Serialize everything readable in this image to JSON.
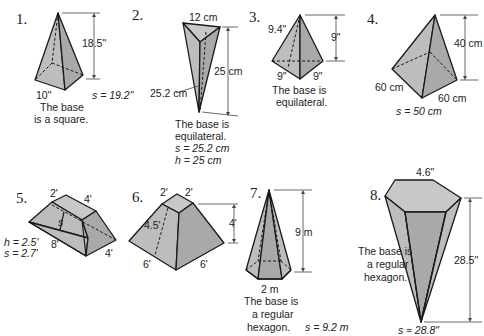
{
  "figures": [
    {
      "number": "1.",
      "dims": {
        "height": "18.5\"",
        "base_edge": "10\"",
        "slant": "s = 19.2\""
      },
      "note": [
        "The base",
        "is a square."
      ]
    },
    {
      "number": "2.",
      "dims": {
        "top_edge": "12 cm",
        "height": "25 cm",
        "slant_label": "25.2 cm"
      },
      "note": [
        "The base is",
        "equilateral.",
        "s = 25.2 cm",
        "h = 25 cm"
      ]
    },
    {
      "number": "3.",
      "dims": {
        "slant": "9.4\"",
        "height": "9\"",
        "base_left": "9\"",
        "base_right": "9\""
      },
      "note": [
        "The base is",
        "equilateral."
      ]
    },
    {
      "number": "4.",
      "dims": {
        "height": "40 cm",
        "base_left": "60 cm",
        "base_right": "60 cm",
        "slant": "s = 50 cm"
      }
    },
    {
      "number": "5.",
      "dims": {
        "top_front": "2'",
        "top_side": "4'",
        "slant_mark": "s",
        "base_front": "8'",
        "base_side": "4'",
        "height": "h = 2.5'",
        "slant": "s = 2.7'"
      }
    },
    {
      "number": "6.",
      "dims": {
        "top_left": "2'",
        "top_right": "2'",
        "height": "4'",
        "slant": "4.5'",
        "base_left": "6'",
        "base_right": "6'"
      }
    },
    {
      "number": "7.",
      "dims": {
        "height": "9 m",
        "base_edge": "2 m",
        "slant": "s = 9.2 m"
      },
      "note": [
        "The base is",
        "a regular",
        "hexagon."
      ]
    },
    {
      "number": "8.",
      "dims": {
        "top_edge": "4.6\"",
        "height": "28.5\"",
        "slant": "s ≈ 28.8\""
      },
      "note": [
        "The base is",
        "a regular",
        "hexagon."
      ]
    }
  ],
  "colors": {
    "face": "#bdbdbd",
    "dark_face": "#a9a9a9",
    "outline": "#1a1a1a",
    "background": "#ffffff"
  }
}
